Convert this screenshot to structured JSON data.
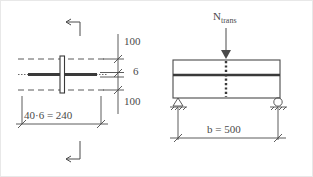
{
  "figure": {
    "background_color": "#ffffff",
    "line_color": "#4a4a4a",
    "border_color": "#e8e8e8"
  },
  "left_view": {
    "name": "cross-section-view",
    "dimensions": {
      "width_label": "40·6 = 240",
      "top_gap_label": "100",
      "middle_thickness_label": "6",
      "bottom_gap_label": "100"
    },
    "callouts": {
      "top_arrow": "section-arrow-top",
      "bottom_arrow": "section-arrow-bottom"
    },
    "elements": {
      "dashed_top": "dashed-edge-top",
      "dashed_bottom": "dashed-edge-bottom",
      "horizontal_plate": "horizontal-plate",
      "vertical_plate": "vertical-plate"
    }
  },
  "right_view": {
    "name": "beam-elevation-view",
    "load_label": "N",
    "load_subscript": "trans",
    "span_label": "b = 500",
    "supports": {
      "left": "pinned-support",
      "right": "roller-support"
    },
    "elements": {
      "beam_outline": "beam-outline",
      "web_line": "beam-web-line",
      "dashed_weld": "dashed-weld-line",
      "load_arrow": "load-arrow"
    }
  }
}
